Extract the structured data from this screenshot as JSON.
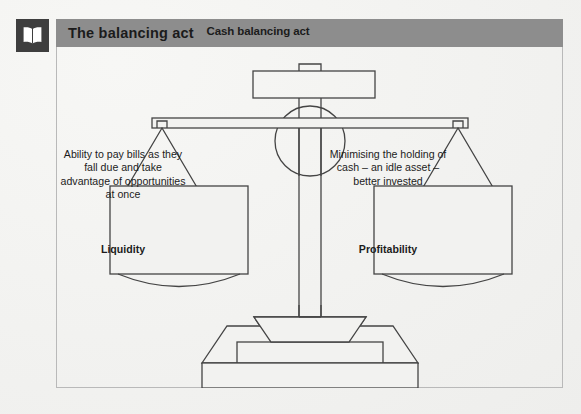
{
  "header": {
    "icon": "open-book-icon",
    "title": "The balancing act"
  },
  "diagram": {
    "type": "balance-scale",
    "top_label": "Cash balancing act",
    "left_pan": {
      "text": "Ability to pay bills as they fall due and take advantage of opportunities at once",
      "caption": "Liquidity"
    },
    "right_pan": {
      "text": "Minimising the holding of cash – an idle asset – better invested",
      "caption": "Profitability"
    }
  },
  "colors": {
    "title_bar": "#8d8d8d",
    "icon_background": "#3e3e3e",
    "stroke": "#444444",
    "frame_border": "#b9b9b9",
    "page_background": "#f2f2f0"
  }
}
